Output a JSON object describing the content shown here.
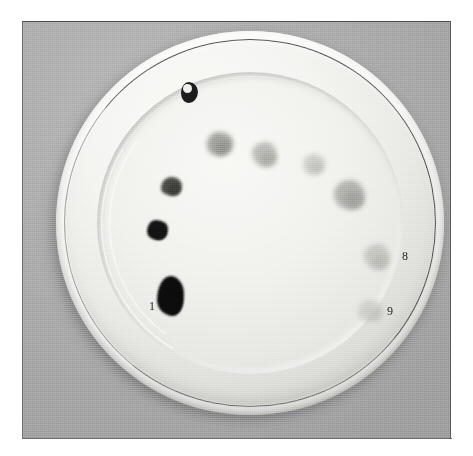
{
  "figure": {
    "kind": "photograph",
    "canvas": {
      "width": 473,
      "height": 456,
      "background": "#ffffff"
    },
    "photo_area": {
      "left": 22,
      "top": 21,
      "width": 429,
      "height": 418,
      "background": "#ababab"
    }
  },
  "plate": {
    "name": "ceramic-plate",
    "fill": "#f4f4f1",
    "rim_ring_color": "#3c3c3c",
    "bounds": {
      "left": 33,
      "top": 9,
      "width": 388,
      "height": 384
    },
    "well_bounds": {
      "left": 74,
      "top": 50,
      "width": 306,
      "height": 302
    }
  },
  "stains": [
    {
      "id": "stain-0",
      "label": "",
      "tone": "black",
      "color": "#1b1b1b",
      "opacity": 1.0,
      "blur": "hard",
      "left": 158,
      "top": 60,
      "width": 17,
      "height": 21,
      "note": "dark ring with pale centre"
    },
    {
      "id": "stain-2",
      "label": "",
      "tone": "mid-grey",
      "color": "#8d8d88",
      "opacity": 0.8,
      "blur": "soft",
      "left": 184,
      "top": 110,
      "width": 26,
      "height": 24
    },
    {
      "id": "stain-3",
      "label": "",
      "tone": "light-grey",
      "color": "#a3a39d",
      "opacity": 0.7,
      "blur": "soft",
      "left": 229,
      "top": 120,
      "width": 25,
      "height": 25
    },
    {
      "id": "stain-4",
      "label": "",
      "tone": "pale-grey",
      "color": "#b8b8b2",
      "opacity": 0.62,
      "blur": "soft",
      "left": 280,
      "top": 132,
      "width": 22,
      "height": 21
    },
    {
      "id": "stain-5",
      "label": "",
      "tone": "dark-grey",
      "color": "#3a3a36",
      "opacity": 0.92,
      "blur": "medium",
      "left": 138,
      "top": 155,
      "width": 21,
      "height": 19
    },
    {
      "id": "stain-6",
      "label": "",
      "tone": "mid-grey",
      "color": "#9a9a94",
      "opacity": 0.72,
      "blur": "soft",
      "left": 311,
      "top": 158,
      "width": 31,
      "height": 30
    },
    {
      "id": "stain-7",
      "label": "",
      "tone": "black",
      "color": "#131313",
      "opacity": 1.0,
      "blur": "hard",
      "left": 124,
      "top": 198,
      "width": 21,
      "height": 20
    },
    {
      "id": "stain-8",
      "label": "8",
      "tone": "pale-grey",
      "color": "#b2b2ac",
      "opacity": 0.62,
      "blur": "soft",
      "left": 341,
      "top": 222,
      "width": 26,
      "height": 26,
      "label_left": 379,
      "label_top": 228
    },
    {
      "id": "stain-9",
      "label": "9",
      "tone": "pale-grey",
      "color": "#bdbdb7",
      "opacity": 0.55,
      "blur": "soft",
      "left": 335,
      "top": 278,
      "width": 25,
      "height": 22,
      "label_left": 364,
      "label_top": 283
    },
    {
      "id": "stain-1",
      "label": "1",
      "tone": "black",
      "color": "#0c0c0c",
      "opacity": 1.0,
      "blur": "hard",
      "left": 134,
      "top": 254,
      "width": 27,
      "height": 40,
      "label_left": 126,
      "label_top": 278,
      "note": "largest, crusty black deposit"
    }
  ],
  "annotations": {
    "visible_numerals": [
      "1",
      "8",
      "9"
    ],
    "numeral_color": "#1c1c1c"
  },
  "colors": {
    "background_grey": "#ababab",
    "plate_white": "#f4f4f1",
    "plate_shadow": "#5a5a5a",
    "ink_black": "#1b1b1b",
    "page_white": "#ffffff"
  }
}
